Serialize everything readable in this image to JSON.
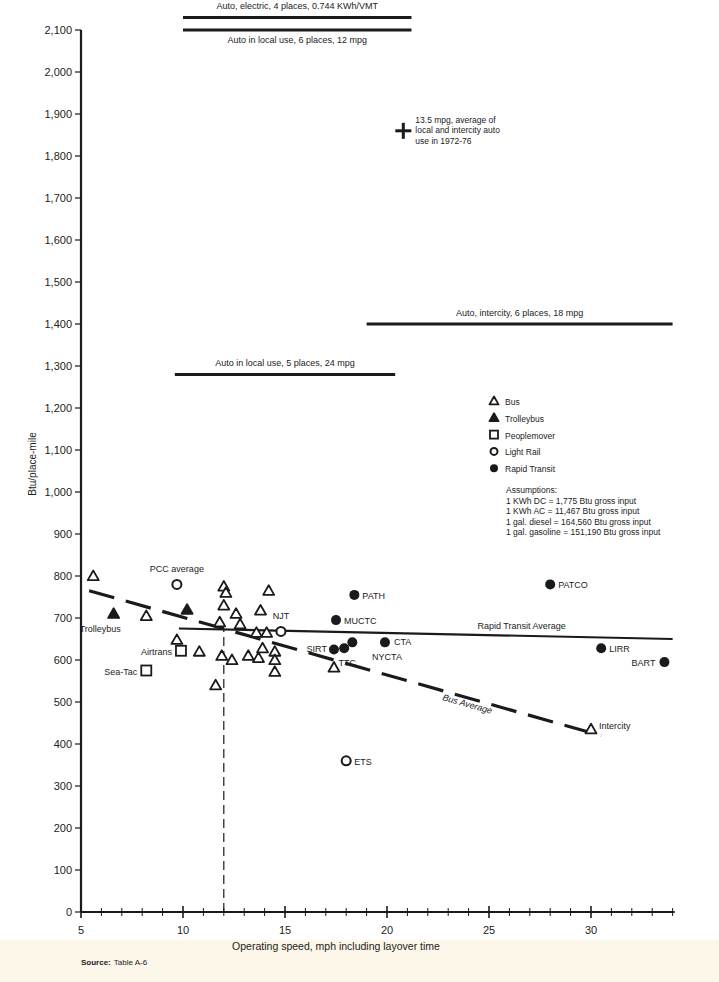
{
  "chart_data": {
    "type": "scatter",
    "title": "",
    "xlabel": "Operating speed, mph including layover time",
    "ylabel": "Btu/place-mile",
    "xlim": [
      5,
      34
    ],
    "ylim": [
      0,
      2100
    ],
    "x_ticks": [
      5,
      10,
      15,
      20,
      25,
      30
    ],
    "y_ticks": [
      0,
      100,
      200,
      300,
      400,
      500,
      600,
      700,
      800,
      900,
      1000,
      1100,
      1200,
      1300,
      1400,
      1500,
      1600,
      1700,
      1800,
      1900,
      2000,
      2100
    ],
    "y_tick_labels": [
      "0",
      "100",
      "200",
      "300",
      "400",
      "500",
      "600",
      "700",
      "800",
      "900",
      "1,000",
      "1,100",
      "1,200",
      "1,300",
      "1,400",
      "1,500",
      "1,600",
      "1,700",
      "1,800",
      "1,900",
      "2,000",
      "2,100"
    ],
    "grid": false,
    "legend_position": "right-middle",
    "series": [
      {
        "name": "Bus",
        "marker": "open-triangle",
        "points": [
          {
            "x": 5.6,
            "y": 800
          },
          {
            "x": 8.2,
            "y": 705
          },
          {
            "x": 9.7,
            "y": 648
          },
          {
            "x": 10.8,
            "y": 620
          },
          {
            "x": 11.6,
            "y": 540
          },
          {
            "x": 11.8,
            "y": 690
          },
          {
            "x": 11.9,
            "y": 610
          },
          {
            "x": 12.0,
            "y": 775
          },
          {
            "x": 12.1,
            "y": 760
          },
          {
            "x": 12.0,
            "y": 730
          },
          {
            "x": 12.4,
            "y": 600
          },
          {
            "x": 12.6,
            "y": 710
          },
          {
            "x": 12.8,
            "y": 685
          },
          {
            "x": 13.2,
            "y": 610
          },
          {
            "x": 13.6,
            "y": 665
          },
          {
            "x": 13.7,
            "y": 605
          },
          {
            "x": 13.8,
            "y": 718
          },
          {
            "x": 13.9,
            "y": 628
          },
          {
            "x": 14.1,
            "y": 665
          },
          {
            "x": 14.2,
            "y": 765
          },
          {
            "x": 14.5,
            "y": 620
          },
          {
            "x": 14.5,
            "y": 600
          },
          {
            "x": 14.5,
            "y": 572
          },
          {
            "x": 17.4,
            "y": 582
          },
          {
            "x": 30.0,
            "y": 435,
            "label": "Intercity"
          }
        ]
      },
      {
        "name": "Trolleybus",
        "marker": "filled-triangle",
        "points": [
          {
            "x": 6.6,
            "y": 710,
            "label": "Trolleybus"
          },
          {
            "x": 10.2,
            "y": 720
          }
        ]
      },
      {
        "name": "Peoplemover",
        "marker": "open-square",
        "points": [
          {
            "x": 9.9,
            "y": 622,
            "label": "Airtrans"
          },
          {
            "x": 8.2,
            "y": 575,
            "label": "Sea-Tac"
          }
        ]
      },
      {
        "name": "Light Rail",
        "marker": "open-circle",
        "points": [
          {
            "x": 9.7,
            "y": 780,
            "label": "PCC average"
          },
          {
            "x": 14.8,
            "y": 668,
            "label": "NJT"
          },
          {
            "x": 18.0,
            "y": 360,
            "label": "ETS"
          }
        ]
      },
      {
        "name": "Rapid Transit",
        "marker": "filled-circle",
        "points": [
          {
            "x": 18.4,
            "y": 755,
            "label": "PATH"
          },
          {
            "x": 17.5,
            "y": 695,
            "label": "MUCTC"
          },
          {
            "x": 17.4,
            "y": 625,
            "label": "SIRT"
          },
          {
            "x": 17.9,
            "y": 628,
            "label": "TTC"
          },
          {
            "x": 18.3,
            "y": 642
          },
          {
            "x": 19.9,
            "y": 642,
            "label": "CTA"
          },
          {
            "x": 28.0,
            "y": 780,
            "label": "PATCO"
          },
          {
            "x": 30.5,
            "y": 628,
            "label": "LIRR"
          },
          {
            "x": 33.6,
            "y": 595,
            "label": "BART"
          }
        ]
      }
    ],
    "reference_lines": [
      {
        "label": "Auto, electric, 4 places, 0.744 KWh/VMT",
        "y": 2130,
        "x_start": 10,
        "x_end": 21.2,
        "label_pos": "above"
      },
      {
        "label": "Auto in local use, 6 places, 12 mpg",
        "y": 2100,
        "x_start": 10,
        "x_end": 21.2,
        "label_pos": "below"
      },
      {
        "label": "Auto, intercity, 6 places, 18 mpg",
        "y": 1400,
        "x_start": 19,
        "x_end": 34,
        "label_pos": "above"
      },
      {
        "label": "Auto in local use, 5 places, 24 mpg",
        "y": 1280,
        "x_start": 9.6,
        "x_end": 20.4,
        "label_pos": "above"
      },
      {
        "label": "Rapid Transit Average",
        "y_start": 675,
        "y_end": 650,
        "x_start": 9.8,
        "x_end": 34,
        "style": "solid"
      },
      {
        "label": "Bus Average",
        "y_start": 765,
        "y_end": 420,
        "x_start": 5.4,
        "x_end": 30.5,
        "style": "dashed"
      },
      {
        "label": "",
        "x": 12.0,
        "y_start": 0,
        "y_end": 675,
        "style": "dashed-vertical"
      }
    ],
    "annotations": [
      {
        "marker": "plus",
        "x": 20.8,
        "y": 1860,
        "text": [
          "13.5 mpg, average of",
          "local and intercity auto",
          "use in 1972-76"
        ]
      },
      {
        "text": "NYCTA",
        "x": 20.0,
        "y": 610
      }
    ]
  },
  "legend": {
    "items": [
      {
        "marker": "open-triangle",
        "label": "Bus"
      },
      {
        "marker": "filled-triangle",
        "label": "Trolleybus"
      },
      {
        "marker": "open-square",
        "label": "Peoplemover"
      },
      {
        "marker": "open-circle",
        "label": "Light Rail"
      },
      {
        "marker": "filled-circle",
        "label": "Rapid Transit"
      }
    ],
    "assumptions_title": "Assumptions:",
    "assumptions": [
      "1 KWh DC = 1,775 Btu gross input",
      "1 KWh AC = 11,467 Btu gross input",
      "1 gal. diesel = 164,560 Btu gross input",
      "1 gal. gasoline = 151,190 Btu gross input"
    ]
  },
  "source": {
    "label": "Source:",
    "text": "Table A-6"
  },
  "colors": {
    "ink": "#1a1a1a",
    "paper": "#ffffff",
    "footer": "#fcf7e8"
  }
}
